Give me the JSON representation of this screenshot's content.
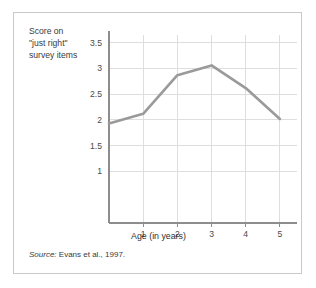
{
  "figure": {
    "y_axis_title": "Score on\n\"just right\"\nsurvey items",
    "x_axis_title": "Age (in years)",
    "source_label": "Source:",
    "source_text": " Evans et al., 1997.",
    "border_color": "#c9c9c9",
    "line_color": "#9a9a9a",
    "grid_color": "#dedede",
    "axis_color": "#8d8d8d"
  },
  "chart_data": {
    "type": "line",
    "title": "",
    "xlabel": "Age (in years)",
    "ylabel": "Score on \"just right\" survey items",
    "x": [
      0,
      1,
      2,
      3,
      4,
      5
    ],
    "values": [
      1.93,
      2.12,
      2.87,
      3.06,
      2.62,
      2.02
    ],
    "series": [
      {
        "name": "Score on \"just right\" survey items",
        "values": [
          1.93,
          2.12,
          2.87,
          3.06,
          2.62,
          2.02
        ]
      }
    ],
    "xlim": [
      0,
      5.5
    ],
    "ylim": [
      0,
      3.65
    ],
    "xticks": [
      1,
      2,
      3,
      4,
      5
    ],
    "xtick_labels": [
      "1",
      "2",
      "3",
      "4",
      "5"
    ],
    "yticks": [
      1,
      1.5,
      2,
      2.5,
      3,
      3.5
    ],
    "ytick_labels": [
      "1",
      "1.5",
      "2",
      "2.5",
      "3",
      "3.5"
    ],
    "grid": true,
    "grid_axis": "both",
    "legend": "none",
    "source": "Source: Evans et al., 1997."
  }
}
